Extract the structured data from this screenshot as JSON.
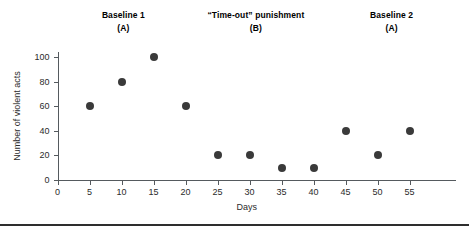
{
  "figure": {
    "background_color": "#ffffff",
    "axis_color": "#555a5e",
    "marker_color": "#3a3a3a",
    "rule_color": "#2e2e2e"
  },
  "phases": [
    {
      "name": "baseline-1",
      "line1": "Baseline 1",
      "line2": "(A)",
      "center_day": 10.3
    },
    {
      "name": "timeout-punishment",
      "line1": "“Time-out” punishment",
      "line2": "(B)",
      "center_day": 31.0
    },
    {
      "name": "baseline-2",
      "line1": "Baseline 2",
      "line2": "(A)",
      "center_day": 52.2
    }
  ],
  "chart_data": {
    "type": "scatter",
    "title": "",
    "xlabel": "Days",
    "ylabel": "Number of violent acts",
    "xlim": [
      0,
      57.5
    ],
    "ylim": [
      0,
      106
    ],
    "xticks": [
      0,
      5,
      10,
      15,
      20,
      25,
      30,
      35,
      40,
      45,
      50,
      55
    ],
    "xtick_labels": [
      "0",
      "5",
      "10",
      "15",
      "20",
      "25",
      "30",
      "35",
      "40",
      "45",
      "50",
      "55"
    ],
    "yticks": [
      0,
      20,
      40,
      60,
      80,
      100
    ],
    "ytick_labels": [
      "0",
      "20",
      "40",
      "60",
      "80",
      "100"
    ],
    "grid": false,
    "legend": false,
    "x": [
      5,
      10,
      15,
      20,
      25,
      30,
      35,
      40,
      45,
      50,
      55
    ],
    "values": [
      60,
      80,
      100,
      60,
      20,
      20,
      10,
      10,
      40,
      20,
      40
    ],
    "points": [
      {
        "x": 5,
        "y": 60,
        "phase": "A1"
      },
      {
        "x": 10,
        "y": 80,
        "phase": "A1"
      },
      {
        "x": 15,
        "y": 100,
        "phase": "A1"
      },
      {
        "x": 20,
        "y": 60,
        "phase": "B"
      },
      {
        "x": 25,
        "y": 20,
        "phase": "B"
      },
      {
        "x": 30,
        "y": 20,
        "phase": "B"
      },
      {
        "x": 35,
        "y": 10,
        "phase": "B"
      },
      {
        "x": 40,
        "y": 10,
        "phase": "B"
      },
      {
        "x": 45,
        "y": 40,
        "phase": "A2"
      },
      {
        "x": 50,
        "y": 20,
        "phase": "A2"
      },
      {
        "x": 55,
        "y": 40,
        "phase": "A2"
      }
    ]
  }
}
